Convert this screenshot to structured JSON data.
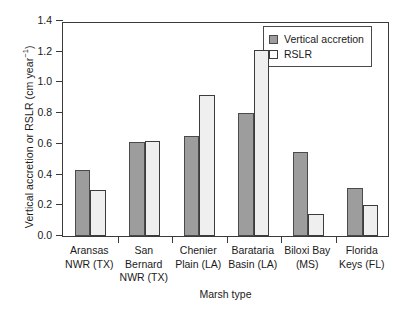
{
  "chart_data": {
    "type": "bar",
    "title": "",
    "xlabel": "Marsh type",
    "ylabel": "Vertical accretion or RSLR (cm year−1)",
    "ylabel_main": "Vertical accretion or RSLR (cm year",
    "ylabel_sup": "−1",
    "ylabel_tail": ")",
    "categories": [
      "Aransas\nNWR (TX)",
      "San\nBernard\nNWR (TX)",
      "Chenier\nPlain (LA)",
      "Barataria\nBasin (LA)",
      "Biloxi Bay\n(MS)",
      "Florida\nKeys (FL)"
    ],
    "series": [
      {
        "name": "Vertical accretion",
        "color": "#9d9d9d",
        "values": [
          0.43,
          0.61,
          0.65,
          0.8,
          0.545,
          0.315
        ]
      },
      {
        "name": "RSLR",
        "color": "#efefef",
        "values": [
          0.3,
          0.62,
          0.92,
          1.21,
          0.145,
          0.205
        ]
      }
    ],
    "ylim": [
      0.0,
      1.4
    ],
    "ytick_values": [
      0.0,
      0.2,
      0.4,
      0.6,
      0.8,
      1.0,
      1.2,
      1.4
    ],
    "ytick_labels": [
      "0.0",
      "0.2",
      "0.4",
      "0.6",
      "0.8",
      "1.0",
      "1.2",
      "1.4"
    ],
    "grid": false,
    "legend_position": "top-right"
  },
  "legend": {
    "items": [
      {
        "label": "Vertical accretion"
      },
      {
        "label": "RSLR"
      }
    ]
  },
  "colors": {
    "accretion": "#9d9d9d",
    "rslr": "#efefef",
    "axis": "#3a3a3a",
    "background": "#ffffff"
  }
}
